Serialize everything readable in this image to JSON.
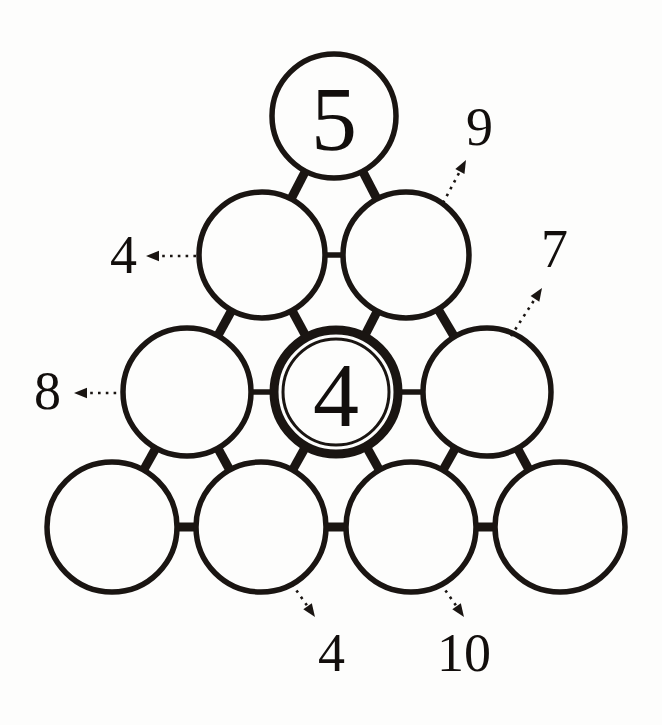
{
  "figure": {
    "background_color": "#fdfdfc",
    "ink_color": "#1a1512",
    "nodes": [
      {
        "id": "r1c1",
        "row": 1,
        "col": 1,
        "cx": 334,
        "cy": 116,
        "r": 62,
        "value": "5",
        "emphasis": false
      },
      {
        "id": "r2c1",
        "row": 2,
        "col": 1,
        "cx": 262,
        "cy": 255,
        "r": 63,
        "value": "",
        "emphasis": false
      },
      {
        "id": "r2c2",
        "row": 2,
        "col": 2,
        "cx": 406,
        "cy": 255,
        "r": 63,
        "value": "",
        "emphasis": false
      },
      {
        "id": "r3c1",
        "row": 3,
        "col": 1,
        "cx": 187,
        "cy": 392,
        "r": 64,
        "value": "",
        "emphasis": false
      },
      {
        "id": "r3c2",
        "row": 3,
        "col": 2,
        "cx": 336,
        "cy": 392,
        "r": 62,
        "value": "4",
        "emphasis": true
      },
      {
        "id": "r3c3",
        "row": 3,
        "col": 3,
        "cx": 487,
        "cy": 392,
        "r": 64,
        "value": "",
        "emphasis": false
      },
      {
        "id": "r4c1",
        "row": 4,
        "col": 1,
        "cx": 112,
        "cy": 527,
        "r": 65,
        "value": "",
        "emphasis": false
      },
      {
        "id": "r4c2",
        "row": 4,
        "col": 2,
        "cx": 261,
        "cy": 527,
        "r": 65,
        "value": "",
        "emphasis": false
      },
      {
        "id": "r4c3",
        "row": 4,
        "col": 3,
        "cx": 411,
        "cy": 527,
        "r": 65,
        "value": "",
        "emphasis": false
      },
      {
        "id": "r4c4",
        "row": 4,
        "col": 4,
        "cx": 560,
        "cy": 527,
        "r": 65,
        "value": "",
        "emphasis": false
      }
    ],
    "links": [
      {
        "from": "r1c1",
        "to": "r2c1",
        "weight": "thick"
      },
      {
        "from": "r1c1",
        "to": "r2c2",
        "weight": "thick"
      },
      {
        "from": "r2c1",
        "to": "r2c2",
        "weight": "thin"
      },
      {
        "from": "r2c1",
        "to": "r3c1",
        "weight": "thick"
      },
      {
        "from": "r2c1",
        "to": "r3c2",
        "weight": "thick"
      },
      {
        "from": "r2c2",
        "to": "r3c2",
        "weight": "thick"
      },
      {
        "from": "r2c2",
        "to": "r3c3",
        "weight": "thick"
      },
      {
        "from": "r3c1",
        "to": "r3c2",
        "weight": "thin"
      },
      {
        "from": "r3c2",
        "to": "r3c3",
        "weight": "thin"
      },
      {
        "from": "r3c1",
        "to": "r4c1",
        "weight": "thick"
      },
      {
        "from": "r3c1",
        "to": "r4c2",
        "weight": "thick"
      },
      {
        "from": "r3c2",
        "to": "r4c2",
        "weight": "thick"
      },
      {
        "from": "r3c2",
        "to": "r4c3",
        "weight": "thick"
      },
      {
        "from": "r3c3",
        "to": "r4c3",
        "weight": "thick"
      },
      {
        "from": "r3c3",
        "to": "r4c4",
        "weight": "thick"
      },
      {
        "from": "r4c1",
        "to": "r4c2",
        "weight": "thick"
      },
      {
        "from": "r4c2",
        "to": "r4c3",
        "weight": "thick"
      },
      {
        "from": "r4c3",
        "to": "r4c4",
        "weight": "thick"
      }
    ],
    "callouts": [
      {
        "id": "callout-9",
        "label": "9",
        "label_x": 466,
        "label_y": 100,
        "arrow_from_x": 443,
        "arrow_from_y": 203,
        "arrow_to_x": 466,
        "arrow_to_y": 160,
        "direction": "up-right"
      },
      {
        "id": "callout-4-upper-left",
        "label": "4",
        "label_x": 110,
        "label_y": 228,
        "arrow_from_x": 196,
        "arrow_from_y": 256,
        "arrow_to_x": 146,
        "arrow_to_y": 256,
        "direction": "left"
      },
      {
        "id": "callout-7",
        "label": "7",
        "label_x": 541,
        "label_y": 222,
        "arrow_from_x": 511,
        "arrow_from_y": 336,
        "arrow_to_x": 542,
        "arrow_to_y": 288,
        "direction": "up-right"
      },
      {
        "id": "callout-8",
        "label": "8",
        "label_x": 34,
        "label_y": 364,
        "arrow_from_x": 124,
        "arrow_from_y": 393,
        "arrow_to_x": 74,
        "arrow_to_y": 393,
        "direction": "left"
      },
      {
        "id": "callout-4-lower",
        "label": "4",
        "label_x": 318,
        "label_y": 626,
        "arrow_from_x": 292,
        "arrow_from_y": 584,
        "arrow_to_x": 315,
        "arrow_to_y": 617,
        "direction": "down-right"
      },
      {
        "id": "callout-10",
        "label": "10",
        "label_x": 437,
        "label_y": 626,
        "arrow_from_x": 441,
        "arrow_from_y": 584,
        "arrow_to_x": 464,
        "arrow_to_y": 617,
        "direction": "down-right"
      }
    ]
  }
}
